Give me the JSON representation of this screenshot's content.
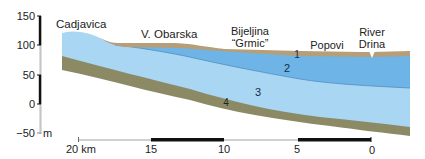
{
  "diagram": {
    "type": "geological-cross-section",
    "vertical_axis": {
      "unit": "m",
      "ticks": [
        {
          "label": "150",
          "y": 16
        },
        {
          "label": "100",
          "y": 45
        },
        {
          "label": "50",
          "y": 75
        },
        {
          "label": "0",
          "y": 104
        },
        {
          "label": "−50",
          "y": 133
        }
      ]
    },
    "locations": [
      {
        "label": "Cadjavica",
        "x": 12,
        "y": 27
      },
      {
        "label": "V. Obarska",
        "x": 142,
        "y": 38
      },
      {
        "label_line1": "Bijeljina",
        "label_line2": "“Grmic”",
        "x": 250,
        "y": 33
      },
      {
        "label": "Popovi",
        "x": 330,
        "y": 48
      },
      {
        "label_line1": "River",
        "label_line2": "Drina",
        "x": 384,
        "y": 36
      }
    ],
    "layer_labels": [
      {
        "label": "1",
        "x": 297,
        "y": 58
      },
      {
        "label": "2",
        "x": 287,
        "y": 72
      },
      {
        "label": "3",
        "x": 258,
        "y": 96
      },
      {
        "label": "4",
        "x": 226,
        "y": 105
      }
    ],
    "scale_bar": {
      "ticks": [
        {
          "label": "20 km",
          "x": 78
        },
        {
          "label": "15",
          "x": 151
        },
        {
          "label": "10",
          "x": 224
        },
        {
          "label": "5",
          "x": 298
        },
        {
          "label": "0",
          "x": 371
        }
      ]
    },
    "colors": {
      "layer1_topsoil": "#b59e78",
      "layer2_aquifer_dark": "#6fb4e6",
      "layer3_aquifer_light": "#a9d6f3",
      "layer4_base": "#8c8a64",
      "axis_black": "#111111",
      "axis_grey": "#bbbbbb"
    }
  }
}
